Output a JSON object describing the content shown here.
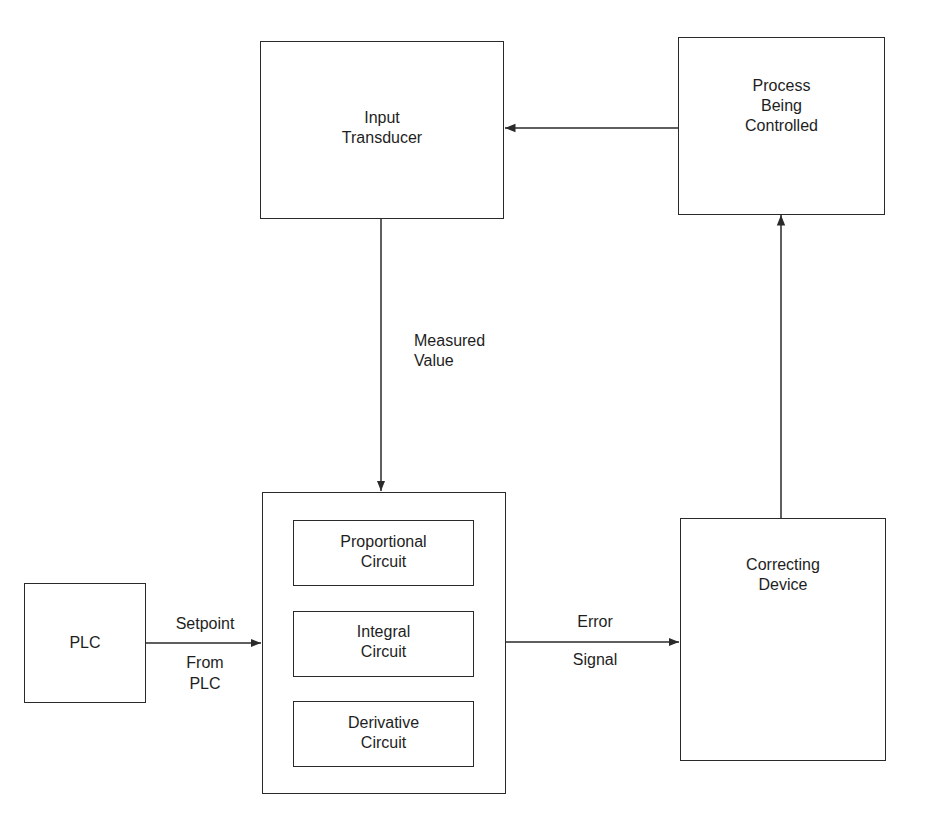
{
  "diagram": {
    "type": "block-diagram",
    "colors": {
      "line": "#2a2a2a",
      "text": "#1e1e1e",
      "background": "#ffffff"
    },
    "blocks": {
      "input_transducer": {
        "line1": "Input",
        "line2": "Transducer"
      },
      "process": {
        "line1": "Process",
        "line2": "Being",
        "line3": "Controlled"
      },
      "pid_controller": {
        "proportional": {
          "line1": "Proportional",
          "line2": "Circuit"
        },
        "integral": {
          "line1": "Integral",
          "line2": "Circuit"
        },
        "derivative": {
          "line1": "Derivative",
          "line2": "Circuit"
        }
      },
      "plc": {
        "line1": "PLC"
      },
      "correcting_device": {
        "line1": "Correcting",
        "line2": "Device"
      }
    },
    "signals": {
      "measured_value": {
        "line1": "Measured",
        "line2": "Value"
      },
      "setpoint": {
        "above": "Setpoint",
        "below1": "From",
        "below2": "PLC"
      },
      "error_signal": {
        "above": "Error",
        "below": "Signal"
      }
    },
    "edges": [
      {
        "from": "Process Being Controlled",
        "to": "Input Transducer"
      },
      {
        "from": "Input Transducer",
        "to": "PID Controller",
        "label": "Measured Value"
      },
      {
        "from": "PLC",
        "to": "PID Controller",
        "label": "Setpoint From PLC"
      },
      {
        "from": "PID Controller",
        "to": "Correcting Device",
        "label": "Error Signal"
      },
      {
        "from": "Correcting Device",
        "to": "Process Being Controlled"
      }
    ]
  }
}
